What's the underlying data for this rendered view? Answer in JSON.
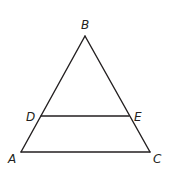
{
  "diagram": {
    "type": "triangle-with-parallel-segment",
    "points": {
      "A": {
        "label": "A",
        "x": 21,
        "y": 152
      },
      "B": {
        "label": "B",
        "x": 85,
        "y": 36
      },
      "C": {
        "label": "C",
        "x": 150,
        "y": 152
      },
      "D": {
        "label": "D",
        "x": 41,
        "y": 116
      },
      "E": {
        "label": "E",
        "x": 129,
        "y": 116
      }
    },
    "segments": [
      "AB",
      "BC",
      "AC",
      "DE"
    ],
    "labels": {
      "A": "A",
      "B": "B",
      "C": "C",
      "D": "D",
      "E": "E"
    }
  }
}
